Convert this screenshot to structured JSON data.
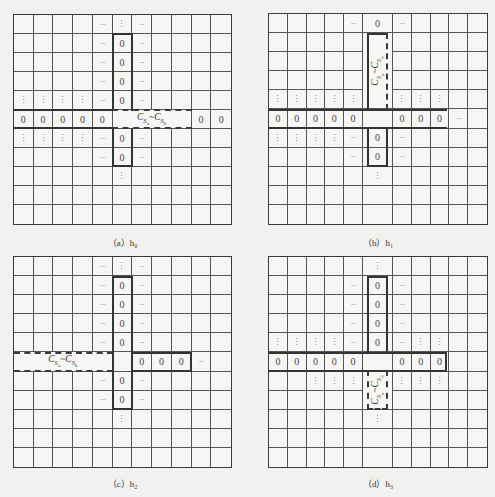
{
  "panels": [
    {
      "id": "a",
      "caption": "（a）h₀",
      "box": {
        "x": 13,
        "y": 14,
        "w": 219,
        "h": 211
      },
      "caption_y": 236,
      "cells": [
        [
          0,
          4,
          "···"
        ],
        [
          0,
          5,
          "⋮"
        ],
        [
          0,
          6,
          "···"
        ],
        [
          1,
          4,
          "···"
        ],
        [
          1,
          5,
          "0"
        ],
        [
          1,
          6,
          "···"
        ],
        [
          2,
          4,
          "···"
        ],
        [
          2,
          5,
          "0"
        ],
        [
          2,
          6,
          "···"
        ],
        [
          3,
          4,
          "···"
        ],
        [
          3,
          5,
          "0"
        ],
        [
          3,
          6,
          "···"
        ],
        [
          4,
          0,
          "⋮"
        ],
        [
          4,
          1,
          "⋮"
        ],
        [
          4,
          2,
          "⋮"
        ],
        [
          4,
          3,
          "⋮"
        ],
        [
          4,
          4,
          "···"
        ],
        [
          4,
          5,
          "0"
        ],
        [
          4,
          6,
          "···"
        ],
        [
          5,
          0,
          "0"
        ],
        [
          5,
          1,
          "0"
        ],
        [
          5,
          2,
          "0"
        ],
        [
          5,
          3,
          "0"
        ],
        [
          5,
          4,
          "0"
        ],
        [
          5,
          9,
          "0"
        ],
        [
          5,
          10,
          "0"
        ],
        [
          6,
          0,
          "⋮"
        ],
        [
          6,
          1,
          "⋮"
        ],
        [
          6,
          2,
          "⋮"
        ],
        [
          6,
          3,
          "⋮"
        ],
        [
          6,
          4,
          "···"
        ],
        [
          6,
          5,
          "0"
        ],
        [
          6,
          6,
          "···"
        ],
        [
          7,
          4,
          "···"
        ],
        [
          7,
          5,
          "0"
        ],
        [
          7,
          6,
          "···"
        ],
        [
          8,
          5,
          "⋮"
        ]
      ],
      "merges": [
        {
          "r": 5,
          "c": 5,
          "rs": 1,
          "cs": 4,
          "label": "C_Sa~C_Sb",
          "vertical": false
        }
      ],
      "outlines": [
        {
          "r": 1,
          "c": 5,
          "rs": 4,
          "cs": 1,
          "style": "solid",
          "sides": "tlr"
        },
        {
          "r": 6,
          "c": 5,
          "rs": 2,
          "cs": 1,
          "style": "solid",
          "sides": "lrb"
        },
        {
          "r": 5,
          "c": 5,
          "rs": 1,
          "cs": 4,
          "style": "dashed",
          "sides": "tb"
        },
        {
          "r": 5,
          "c": 0,
          "rs": 1,
          "cs": 5,
          "style": "solid",
          "sides": "tb"
        }
      ]
    },
    {
      "id": "b",
      "caption": "（b）h₁",
      "box": {
        "x": 268,
        "y": 13,
        "w": 220,
        "h": 212
      },
      "caption_y": 236,
      "cells": [
        [
          0,
          4,
          "···"
        ],
        [
          0,
          5,
          "0"
        ],
        [
          0,
          6,
          "···"
        ],
        [
          4,
          0,
          "⋮"
        ],
        [
          4,
          1,
          "⋮"
        ],
        [
          4,
          2,
          "⋮"
        ],
        [
          4,
          3,
          "⋮"
        ],
        [
          4,
          4,
          "⋮"
        ],
        [
          4,
          6,
          "⋮"
        ],
        [
          4,
          7,
          "⋮"
        ],
        [
          4,
          8,
          "⋮"
        ],
        [
          5,
          0,
          "0"
        ],
        [
          5,
          1,
          "0"
        ],
        [
          5,
          2,
          "0"
        ],
        [
          5,
          3,
          "0"
        ],
        [
          5,
          4,
          "0"
        ],
        [
          5,
          6,
          "0"
        ],
        [
          5,
          7,
          "0"
        ],
        [
          5,
          8,
          "0"
        ],
        [
          5,
          9,
          "···"
        ],
        [
          6,
          0,
          "⋮"
        ],
        [
          6,
          1,
          "⋮"
        ],
        [
          6,
          2,
          "⋮"
        ],
        [
          6,
          3,
          "⋮"
        ],
        [
          6,
          4,
          "···"
        ],
        [
          6,
          5,
          "0"
        ],
        [
          6,
          6,
          "···"
        ],
        [
          7,
          4,
          "···"
        ],
        [
          7,
          5,
          "0"
        ],
        [
          7,
          6,
          "···"
        ],
        [
          8,
          5,
          "⋮"
        ]
      ],
      "merges": [
        {
          "r": 1,
          "c": 5,
          "rs": 4,
          "cs": 1,
          "label": "C_Sa~C_Sb",
          "vertical": true
        }
      ],
      "outlines": [
        {
          "r": 1,
          "c": 5,
          "rs": 4,
          "cs": 1,
          "style": "solid",
          "sides": "tl"
        },
        {
          "r": 1,
          "c": 5,
          "rs": 4,
          "cs": 1,
          "style": "dashed",
          "sides": "r"
        },
        {
          "r": 5,
          "c": 0,
          "rs": 1,
          "cs": 9,
          "style": "solid",
          "sides": "tb"
        },
        {
          "r": 6,
          "c": 5,
          "rs": 2,
          "cs": 1,
          "style": "solid",
          "sides": "lrb"
        }
      ]
    },
    {
      "id": "c",
      "caption": "（c）h₂",
      "box": {
        "x": 13,
        "y": 256,
        "w": 219,
        "h": 212
      },
      "caption_y": 477,
      "cells": [
        [
          0,
          4,
          "···"
        ],
        [
          0,
          5,
          "⋮"
        ],
        [
          0,
          6,
          "···"
        ],
        [
          1,
          4,
          "···"
        ],
        [
          1,
          5,
          "0"
        ],
        [
          1,
          6,
          "···"
        ],
        [
          2,
          4,
          "···"
        ],
        [
          2,
          5,
          "0"
        ],
        [
          2,
          6,
          "···"
        ],
        [
          3,
          4,
          "···"
        ],
        [
          3,
          5,
          "0"
        ],
        [
          3,
          6,
          "···"
        ],
        [
          4,
          4,
          "···"
        ],
        [
          4,
          5,
          "0"
        ],
        [
          4,
          6,
          "···"
        ],
        [
          5,
          6,
          "0"
        ],
        [
          5,
          7,
          "0"
        ],
        [
          5,
          8,
          "0"
        ],
        [
          5,
          9,
          "···"
        ],
        [
          6,
          4,
          "···"
        ],
        [
          6,
          5,
          "0"
        ],
        [
          6,
          6,
          "···"
        ],
        [
          7,
          4,
          "···"
        ],
        [
          7,
          5,
          "0"
        ],
        [
          7,
          6,
          "···"
        ],
        [
          8,
          5,
          "⋮"
        ]
      ],
      "merges": [
        {
          "r": 5,
          "c": 0,
          "rs": 1,
          "cs": 5,
          "label": "C_Sa~C_Sb",
          "vertical": false
        }
      ],
      "outlines": [
        {
          "r": 5,
          "c": 0,
          "rs": 1,
          "cs": 5,
          "style": "dashed",
          "sides": "tb"
        },
        {
          "r": 1,
          "c": 5,
          "rs": 7,
          "cs": 1,
          "style": "solid",
          "sides": "tlrb"
        },
        {
          "r": 5,
          "c": 6,
          "rs": 1,
          "cs": 3,
          "style": "solid",
          "sides": "tbr"
        }
      ]
    },
    {
      "id": "d",
      "caption": "（d）h₃",
      "box": {
        "x": 268,
        "y": 256,
        "w": 220,
        "h": 212
      },
      "caption_y": 477,
      "cells": [
        [
          0,
          5,
          "⋮"
        ],
        [
          1,
          4,
          "···"
        ],
        [
          1,
          5,
          "0"
        ],
        [
          1,
          6,
          "···"
        ],
        [
          2,
          4,
          "···"
        ],
        [
          2,
          5,
          "0"
        ],
        [
          2,
          6,
          "···"
        ],
        [
          3,
          4,
          "···"
        ],
        [
          3,
          5,
          "0"
        ],
        [
          3,
          6,
          "···"
        ],
        [
          4,
          0,
          "⋮"
        ],
        [
          4,
          1,
          "⋮"
        ],
        [
          4,
          2,
          "⋮"
        ],
        [
          4,
          3,
          "⋮"
        ],
        [
          4,
          4,
          "···"
        ],
        [
          4,
          5,
          "0"
        ],
        [
          4,
          6,
          "···"
        ],
        [
          4,
          7,
          "⋮"
        ],
        [
          4,
          8,
          "⋮"
        ],
        [
          5,
          0,
          "0"
        ],
        [
          5,
          1,
          "0"
        ],
        [
          5,
          2,
          "0"
        ],
        [
          5,
          3,
          "0"
        ],
        [
          5,
          4,
          "0"
        ],
        [
          5,
          6,
          "0"
        ],
        [
          5,
          7,
          "0"
        ],
        [
          5,
          8,
          "0"
        ],
        [
          6,
          2,
          "⋮"
        ],
        [
          6,
          3,
          "⋮"
        ],
        [
          6,
          4,
          "⋮"
        ],
        [
          6,
          6,
          "⋮"
        ],
        [
          6,
          7,
          "⋮"
        ],
        [
          6,
          8,
          "⋮"
        ],
        [
          8,
          5,
          "⋮"
        ]
      ],
      "merges": [
        {
          "r": 6,
          "c": 5,
          "rs": 2,
          "cs": 1,
          "label": "C_Sa~C_Sb",
          "vertical": true
        }
      ],
      "outlines": [
        {
          "r": 1,
          "c": 5,
          "rs": 4,
          "cs": 1,
          "style": "solid",
          "sides": "tlr"
        },
        {
          "r": 5,
          "c": 0,
          "rs": 1,
          "cs": 9,
          "style": "solid",
          "sides": "tbr"
        },
        {
          "r": 6,
          "c": 5,
          "rs": 2,
          "cs": 1,
          "style": "dashed",
          "sides": "lrb"
        }
      ]
    }
  ],
  "grid": {
    "rows": 11,
    "cols": 11
  },
  "colors": {
    "line": "#555555",
    "border": "#3a3a3a",
    "background": "#f1f1ef",
    "text": "#333333"
  }
}
